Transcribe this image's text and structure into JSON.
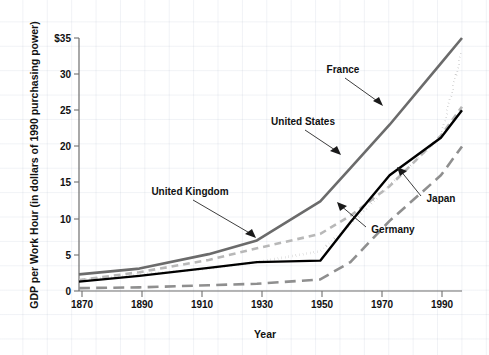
{
  "chart_data": {
    "type": "line",
    "title": "",
    "xlabel": "Year",
    "ylabel": "GDP per Work Hour (in dollars of 1990 purchasing power)",
    "xlim": [
      1870,
      1997
    ],
    "ylim": [
      0,
      35
    ],
    "grid": true,
    "legend_position": "inline-annotations",
    "x_ticks": [
      "1870",
      "1890",
      "1910",
      "1930",
      "1950",
      "1970",
      "1990"
    ],
    "x_tick_values": [
      1870,
      1890,
      1910,
      1930,
      1950,
      1970,
      1990
    ],
    "y_ticks": [
      "0",
      "5",
      "10",
      "15",
      "20",
      "25",
      "30",
      "$35"
    ],
    "y_tick_values": [
      0,
      5,
      10,
      15,
      20,
      25,
      30,
      35
    ],
    "x": [
      1870,
      1890,
      1913,
      1929,
      1950,
      1960,
      1973,
      1990,
      1997
    ],
    "series": [
      {
        "name": "France",
        "style": "solid",
        "color": "#6b6b6b",
        "width": 2.6,
        "values": [
          2.3,
          3.1,
          5.1,
          7.0,
          12.4,
          17.0,
          23.0,
          31.5,
          35.0
        ]
      },
      {
        "name": "United States",
        "style": "dotted",
        "color": "#3f3f3f",
        "width": 2.6,
        "values": [
          1.5,
          2.3,
          3.1,
          4.0,
          5.5,
          9.2,
          14.6,
          21.3,
          33.3
        ]
      },
      {
        "name": "United Kingdom",
        "style": "dashed",
        "color": "#b8b8b8",
        "width": 2.6,
        "values": [
          1.5,
          2.6,
          4.3,
          5.9,
          7.9,
          10.4,
          14.5,
          21.5,
          25.5
        ]
      },
      {
        "name": "Germany",
        "style": "solid",
        "color": "#000000",
        "width": 2.4,
        "values": [
          1.3,
          2.1,
          3.2,
          4.0,
          4.2,
          9.5,
          16.0,
          21.2,
          25.0
        ]
      },
      {
        "name": "Japan",
        "style": "long-dashed",
        "color": "#8f8f8f",
        "width": 2.6,
        "values": [
          0.4,
          0.5,
          0.8,
          1.0,
          1.6,
          4.0,
          9.7,
          16.0,
          20.0
        ]
      }
    ],
    "annotations": [
      {
        "text": "France",
        "series": "France"
      },
      {
        "text": "United States",
        "series": "United States"
      },
      {
        "text": "United Kingdom",
        "series": "United Kingdom"
      },
      {
        "text": "Germany",
        "series": "Germany"
      },
      {
        "text": "Japan",
        "series": "Japan"
      }
    ]
  }
}
